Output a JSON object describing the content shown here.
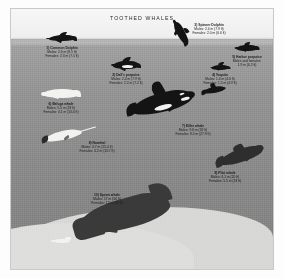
{
  "plate": {
    "title": "TOOTHED WHALES",
    "background": {
      "sky_color": "#f2f2f2",
      "water_color": "#8e8e8e",
      "seabed_color": "#d8d8d6",
      "frame_color": "#ffffff"
    }
  },
  "species": [
    {
      "id": 1,
      "name": "1) Common Dolphin",
      "male": "Males:  2.6 m (8.5 ft)",
      "female": "Females:  2.3 m (7.5 ft)",
      "art": "common-dolphin"
    },
    {
      "id": 2,
      "name": "2) Dall's porpoise",
      "male": "Males:  2.4 m (7.9 ft)",
      "female": "Females:  2.2 m (7.2 ft)",
      "art": "dalls-porpoise"
    },
    {
      "id": 3,
      "name": "3) Spinner Dolphin",
      "male": "Males:  2.4 m (7.9 ft)",
      "female": "Females:  2.0 m (6.6 ft)",
      "art": "spinner-dolphin"
    },
    {
      "id": 4,
      "name": "4) Vaquita",
      "male": "Males:  1.4 m (4.6 ft)",
      "female": "Females:  1.5 m (4.9 ft)",
      "art": "vaquita"
    },
    {
      "id": 5,
      "name": "5) Harbor porpoise",
      "male": "Males and females:",
      "female": "1.9 m (6.2 ft)",
      "art": "harbor-porpoise"
    },
    {
      "id": 6,
      "name": "6) Beluga whale",
      "male": "Males:  5.5 m (18 ft)",
      "female": "Females:  4.1 m (13.4 ft)",
      "art": "beluga-whale"
    },
    {
      "id": 7,
      "name": "7) Killer whale",
      "male": "Males:  9.8 m (32 ft)",
      "female": "Females:  8.5 m (27.9 ft)",
      "art": "killer-whale"
    },
    {
      "id": 8,
      "name": "8) Narwhal",
      "male": "Males:  4.7 m (15.4 ft)",
      "female": "Females:  4.2 m (13.7 ft)",
      "art": "narwhal"
    },
    {
      "id": 9,
      "name": "9) Pilot whale",
      "male": "Males:  6.1 m (20 ft)",
      "female": "Females:  5.5 m (18 ft)",
      "art": "pilot-whale"
    },
    {
      "id": 10,
      "name": "10) Sperm whale",
      "male": "Males:  17 m (56 ft)",
      "female": "Females:  12 m (39 ft)",
      "art": "sperm-whale"
    }
  ]
}
